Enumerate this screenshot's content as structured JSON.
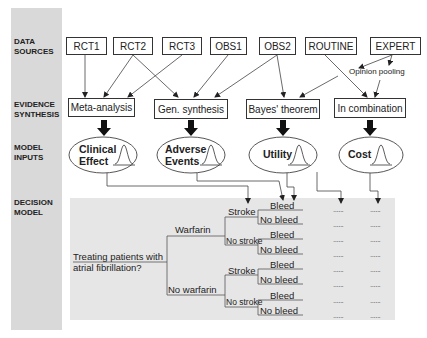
{
  "row_labels": [
    {
      "line1": "DATA",
      "line2": "SOURCES"
    },
    {
      "line1": "EVIDENCE",
      "line2": "SYNTHESIS"
    },
    {
      "line1": "MODEL",
      "line2": "INPUTS"
    },
    {
      "line1": "DECISION",
      "line2": "MODEL"
    }
  ],
  "data_sources": [
    "RCT1",
    "RCT2",
    "RCT3",
    "OBS1",
    "OBS2",
    "ROUTINE",
    "EXPERT"
  ],
  "opinion_pooling": "Opinion pooling",
  "evidence_synthesis": [
    "Meta-analysis",
    "Gen. synthesis",
    "Bayes' theorem",
    "In combination"
  ],
  "model_inputs": [
    {
      "line1": "Clinical",
      "line2": "Effect"
    },
    {
      "line1": "Adverse",
      "line2": "Events"
    },
    {
      "line1": "Utility",
      "line2": ""
    },
    {
      "line1": "Cost",
      "line2": ""
    }
  ],
  "decision_tree": {
    "question_line1": "Treating patients with",
    "question_line2": "atrial fibrillation?",
    "treatments": [
      "Warfarin",
      "No warfarin"
    ],
    "stroke_outcomes": [
      "Stroke",
      "No stroke"
    ],
    "bleed_outcomes": [
      "Bleed",
      "No bleed"
    ],
    "placeholder": "......"
  }
}
